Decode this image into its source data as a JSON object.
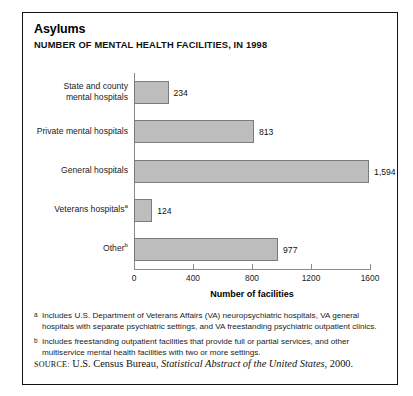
{
  "figure": {
    "title": "Asylums",
    "subtitle": "NUMBER OF MENTAL HEALTH FACILITIES, IN 1998"
  },
  "chart_data": {
    "type": "bar",
    "orientation": "horizontal",
    "title": "Asylums",
    "subtitle": "NUMBER OF MENTAL HEALTH FACILITIES, IN 1998",
    "xlabel": "Number of facilities",
    "ylabel": "",
    "xlim": [
      0,
      1600
    ],
    "xticks": [
      0,
      400,
      800,
      1200,
      1600
    ],
    "xtick_labels": [
      "0",
      "400",
      "800",
      "1200",
      "1600"
    ],
    "grid": false,
    "legend": null,
    "bar_color": "#bdbdbd",
    "bar_edge_color": "#7b7b7b",
    "categories": [
      "State and county mental hospitals",
      "Private mental hospitals",
      "General hospitals",
      "Veterans hospitals",
      "Other"
    ],
    "category_lines": [
      [
        "State and county",
        "mental hospitals"
      ],
      [
        "Private mental hospitals"
      ],
      [
        "General hospitals"
      ],
      [
        "Veterans hospitals"
      ],
      [
        "Other"
      ]
    ],
    "category_footnote_markers": [
      "",
      "",
      "",
      "a",
      "b"
    ],
    "values": [
      234,
      813,
      1594,
      124,
      977
    ],
    "value_labels": [
      "234",
      "813",
      "1,594",
      "124",
      "977"
    ]
  },
  "notes": [
    {
      "marker": "a",
      "text": "Includes U.S. Department of Veterans Affairs (VA) neuropsychiatric hospitals, VA general hospitals with separate psychiatric settings, and VA freestanding psychiatric outpatient clinics."
    },
    {
      "marker": "b",
      "text": "Includes freestanding outpatient facilities that provide full or partial services, and other multiservice mental health facilities with two or more settings."
    }
  ],
  "source": {
    "lead": "SOURCE:",
    "before_italic": " U.S. Census Bureau, ",
    "italic": "Statistical Abstract of the United States",
    "after_italic": ", 2000."
  }
}
